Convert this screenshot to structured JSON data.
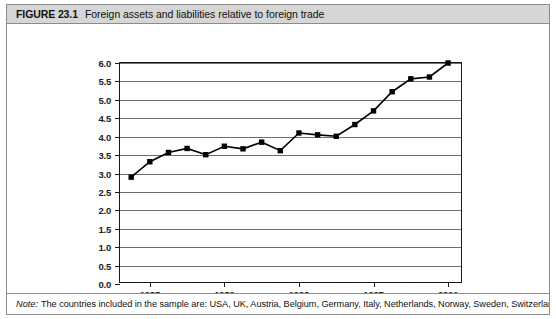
{
  "figure": {
    "label": "FIGURE 23.1",
    "title": "Foreign assets and liabilities relative to foreign trade"
  },
  "note": {
    "prefix": "Note:",
    "text": "The countries included in the sample are: USA, UK, Austria, Belgium, Germany, Italy, Netherlands, Norway, Sweden, Switzerland, Canada,"
  },
  "colors": {
    "title_bar_background": "#d6d6d6",
    "frame_border": "#8c8c8c",
    "axis": "#1a1a1a",
    "gridline": "#6e6e6e",
    "series": "#000000"
  },
  "chart_data": {
    "type": "line",
    "title": "Foreign assets and liabilities relative to foreign trade",
    "xlabel": "Year",
    "ylabel": "",
    "xlim": [
      1983.4,
      2001.8
    ],
    "ylim": [
      0.0,
      6.0
    ],
    "grid": true,
    "legend": "none",
    "marker": "square",
    "x_tick_labels": [
      "1985",
      "1989",
      "1993",
      "1997",
      "2001"
    ],
    "x_ticks": [
      1985,
      1989,
      1993,
      1997,
      2001
    ],
    "y_tick_labels": [
      "0.0",
      "0.5",
      "1.0",
      "1.5",
      "2.0",
      "2.5",
      "3.0",
      "3.5",
      "4.0",
      "4.5",
      "5.0",
      "5.5",
      "6.0"
    ],
    "y_ticks": [
      0.0,
      0.5,
      1.0,
      1.5,
      2.0,
      2.5,
      3.0,
      3.5,
      4.0,
      4.5,
      5.0,
      5.5,
      6.0
    ],
    "x": [
      1984,
      1985,
      1986,
      1987,
      1988,
      1989,
      1990,
      1991,
      1992,
      1993,
      1994,
      1995,
      1996,
      1997,
      1998,
      1999,
      2000,
      2001
    ],
    "values": [
      2.9,
      3.32,
      3.57,
      3.68,
      3.51,
      3.74,
      3.67,
      3.85,
      3.62,
      4.1,
      4.05,
      4.01,
      4.33,
      4.7,
      5.22,
      5.57,
      5.62,
      6.0
    ],
    "series": [
      {
        "name": "Foreign assets and liabilities relative to foreign trade",
        "values": [
          2.9,
          3.32,
          3.57,
          3.68,
          3.51,
          3.74,
          3.67,
          3.85,
          3.62,
          4.1,
          4.05,
          4.01,
          4.33,
          4.7,
          5.22,
          5.57,
          5.62,
          6.0
        ]
      }
    ]
  }
}
